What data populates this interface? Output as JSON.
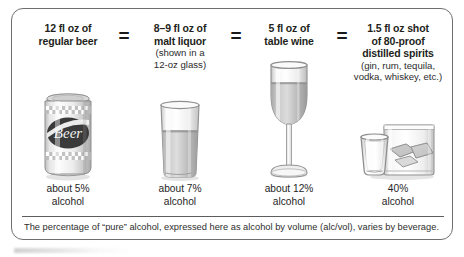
{
  "card": {
    "columns": [
      {
        "id": "beer",
        "heading_line1": "12 fl oz of",
        "heading_line2": "regular beer",
        "sub_line1": "",
        "sub_line2": "",
        "illustration": "beer-can-illustration",
        "pct_line1": "about 5%",
        "pct_line2": "alcohol"
      },
      {
        "id": "malt-liquor",
        "heading_line1": "8–9 fl oz of",
        "heading_line2": "malt liquor",
        "sub_line1": "(shown in a",
        "sub_line2": "12-oz glass)",
        "illustration": "malt-liquor-glass-illustration",
        "pct_line1": "about 7%",
        "pct_line2": "alcohol"
      },
      {
        "id": "table-wine",
        "heading_line1": "5 fl oz of",
        "heading_line2": "table wine",
        "sub_line1": "",
        "sub_line2": "",
        "illustration": "wine-glass-illustration",
        "pct_line1": "about 12%",
        "pct_line2": "alcohol"
      },
      {
        "id": "distilled-spirits",
        "heading_line1": "1.5 fl oz shot",
        "heading_line2": "of 80-proof",
        "heading_line3": "distilled spirits",
        "sub_line1": "(gin, rum, tequila,",
        "sub_line2": "vodka, whiskey, etc.)",
        "illustration": "shot-and-rocks-glass-illustration",
        "pct_line1": "40%",
        "pct_line2": "alcohol"
      }
    ],
    "equals": [
      "=",
      "=",
      "="
    ],
    "beer_can_label": "Beer",
    "footnote": "The percentage of “pure” alcohol, expressed here as alcohol by volume (alc/vol), varies by beverage."
  },
  "colors": {
    "border": "#6e6e6e",
    "text": "#231f20",
    "liquid": "#a8a8a8",
    "glass": "#e9e9e9"
  }
}
